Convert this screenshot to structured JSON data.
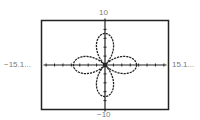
{
  "window": {
    "ymax_label": "10",
    "ymin_label": "−10",
    "xmin_label": "−15.1...",
    "xmax_label": "15.1..."
  },
  "chart_data": {
    "type": "line",
    "title": "",
    "equation_form": "r = 8 cos(2θ)",
    "xlabel": "",
    "ylabel": "",
    "xlim": [
      -15.1,
      15.1
    ],
    "ylim": [
      -10,
      10
    ],
    "tick_labels": {
      "x": [
        "−15.1...",
        "15.1..."
      ],
      "y": [
        "−10",
        "10"
      ]
    },
    "x_tick_spacing": 2,
    "y_tick_spacing": 2,
    "grid": false,
    "legend": null,
    "petal_radius": 7.5,
    "petal_directions_deg": [
      0,
      90,
      180,
      270
    ],
    "line_style": "dashed",
    "colors": {
      "curve": "#222222",
      "axes": "#222222",
      "frame": "#222222",
      "labels": "#7a7a7a"
    }
  }
}
